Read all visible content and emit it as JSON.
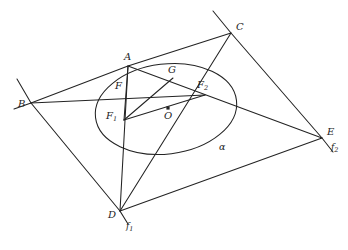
{
  "figure": {
    "width": 348,
    "height": 250,
    "background": "#ffffff",
    "stroke_color": "#232323",
    "label_color": "#232323"
  },
  "labels": {
    "A": "A",
    "B": "B",
    "C": "C",
    "D": "D",
    "E": "E",
    "F": "F",
    "G": "G",
    "O": "O",
    "F1_base": "F",
    "F1_sub": "1",
    "F2_base": "F",
    "F2_sub": "2",
    "f1_base": "f",
    "f1_sub": "1",
    "f2_base": "f",
    "f2_sub": "2",
    "alpha": "α"
  },
  "geometry": {
    "type": "euclidean-diagram",
    "conic": {
      "name": "alpha",
      "kind": "ellipse",
      "center": [
        166,
        109
      ],
      "semi_major": 71,
      "semi_minor": 45,
      "rotation_deg": -7
    },
    "points": [
      {
        "name": "A",
        "x": 128,
        "y": 66,
        "label_x": 124,
        "label_y": 52
      },
      {
        "name": "B",
        "x": 31,
        "y": 103,
        "label_x": 18,
        "label_y": 99
      },
      {
        "name": "C",
        "x": 231,
        "y": 33,
        "label_x": 236,
        "label_y": 22
      },
      {
        "name": "D",
        "x": 120,
        "y": 211,
        "label_x": 108,
        "label_y": 210
      },
      {
        "name": "E",
        "x": 322,
        "y": 138,
        "label_x": 327,
        "label_y": 127
      },
      {
        "name": "F",
        "x": 129,
        "y": 93,
        "label_x": 115,
        "label_y": 81
      },
      {
        "name": "G",
        "x": 173,
        "y": 78,
        "label_x": 168,
        "label_y": 65
      },
      {
        "name": "O",
        "x": 168,
        "y": 108,
        "label_x": 164,
        "label_y": 111
      },
      {
        "name": "F1",
        "x": 124,
        "y": 120,
        "label_x": 108,
        "label_y": 111
      },
      {
        "name": "F2",
        "x": 205,
        "y": 95,
        "label_x": 199,
        "label_y": 80
      }
    ],
    "marked_points": [
      "O"
    ],
    "segments": [
      {
        "from": "B",
        "to": "A",
        "note": "tangent side B-A"
      },
      {
        "from": "A",
        "to": "C",
        "note": "tangent side A-C continues B-A"
      },
      {
        "from": "B",
        "to": "D",
        "note": "tangent side B-D"
      },
      {
        "from": "C",
        "to": "E",
        "note": "tangent side C-E"
      },
      {
        "from": "D",
        "to": "E",
        "note": "tangent side D-E"
      },
      {
        "from": "B",
        "to": "F2",
        "note": "cevian B to F2"
      },
      {
        "from": "D",
        "to": "C",
        "note": "diagonal D-C through G"
      },
      {
        "from": "A",
        "to": "E",
        "note": "diagonal A-E through G and F2"
      },
      {
        "from": "A",
        "to": "D",
        "note": "line A-D, line f1"
      },
      {
        "from": "F1",
        "to": "A",
        "note": "focal ray F1-A"
      },
      {
        "from": "F1",
        "to": "G",
        "note": "focal ray F1-G"
      },
      {
        "from": "F1",
        "to": "F2",
        "note": "focal axis F1-F2"
      }
    ],
    "lines": [
      {
        "name": "f1",
        "through": [
          "A",
          "D"
        ],
        "label_x": 128,
        "label_y": 225,
        "note": "tangent-ish line labelled f1 below D"
      },
      {
        "name": "f2",
        "through": [
          "C",
          "E"
        ],
        "label_x": 333,
        "label_y": 145,
        "note": "line labelled f2 below E"
      }
    ]
  }
}
